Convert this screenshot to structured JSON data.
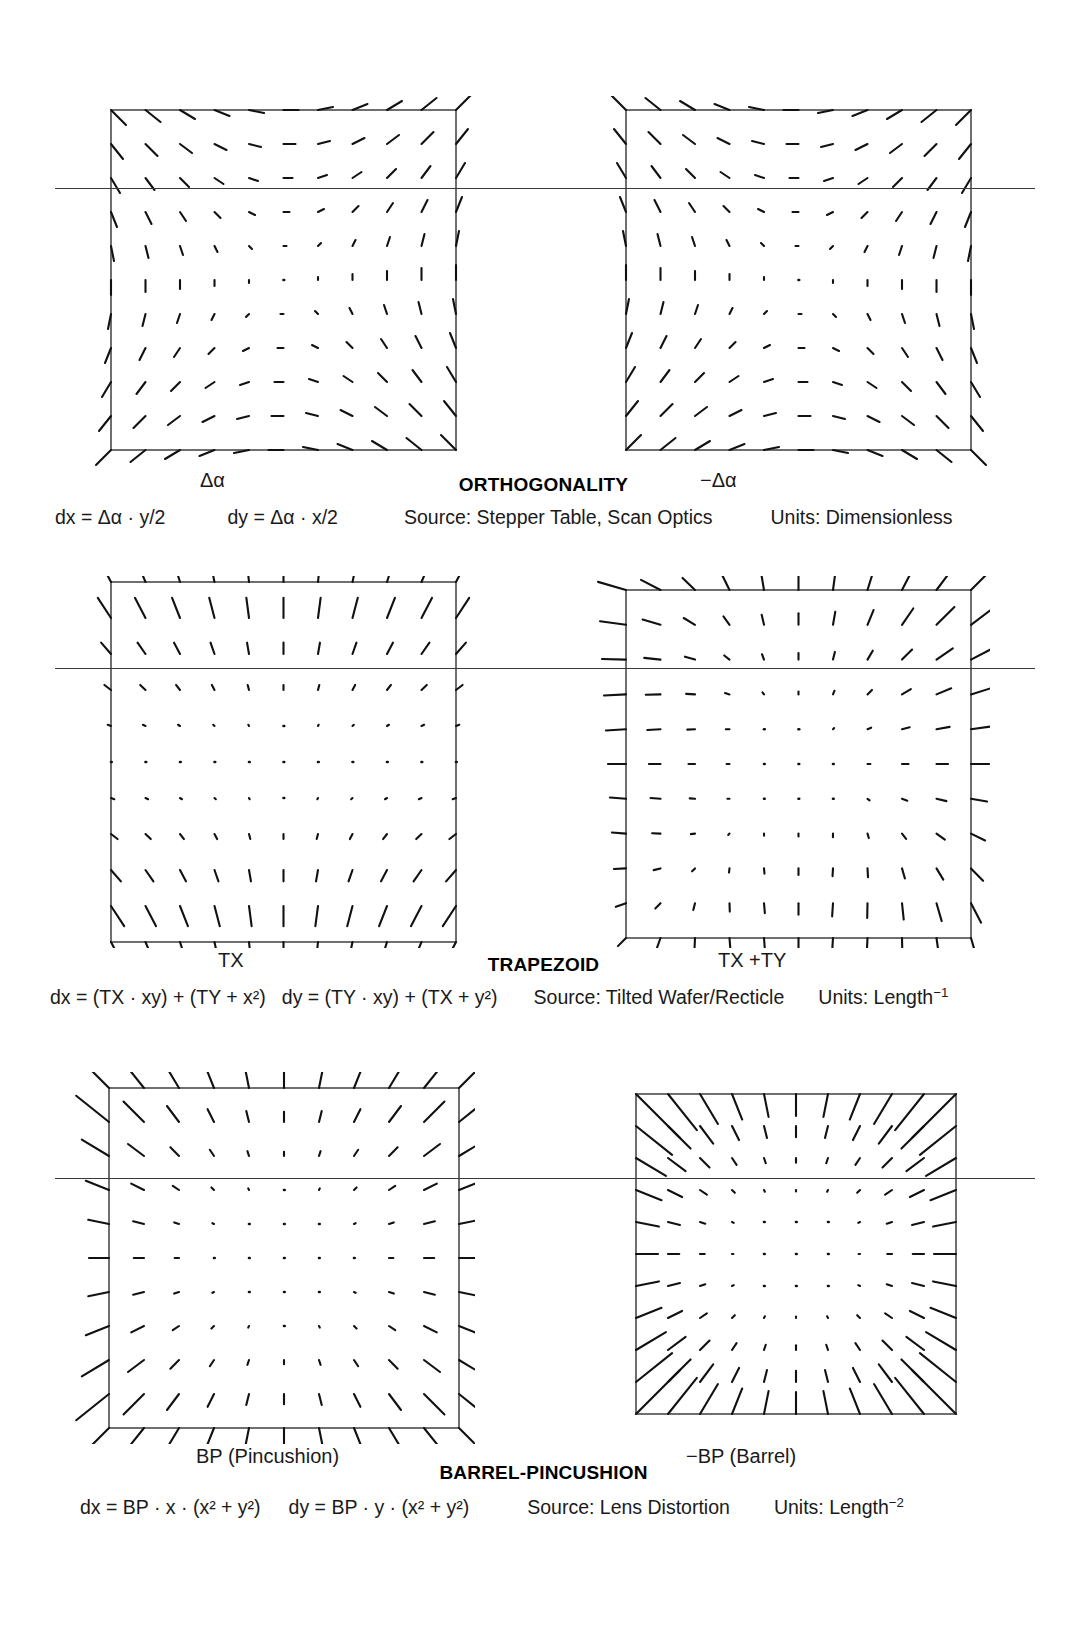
{
  "sections": [
    {
      "id": "orthogonality",
      "title": "ORTHOGONALITY",
      "left_panel_label": "Δα",
      "right_panel_label": "−Δα",
      "formula_dx": "dx = Δα · y/2",
      "formula_dy": "dy = Δα · x/2",
      "source": "Source: Stepper Table, Scan Optics",
      "units_prefix": "Units: Dimensionless",
      "units_sup": ""
    },
    {
      "id": "trapezoid",
      "title": "TRAPEZOID",
      "left_panel_label": "TX",
      "right_panel_label": "TX +TY",
      "formula_dx": "dx = (TX · xy) + (TY + x²)",
      "formula_dy": "dy = (TY · xy) + (TX + y²)",
      "source": "Source: Tilted Wafer/Recticle",
      "units_prefix": "Units: Length",
      "units_sup": "−1"
    },
    {
      "id": "barrel-pincushion",
      "title": "BARREL-PINCUSHION",
      "left_panel_label": "BP (Pincushion)",
      "right_panel_label": "−BP (Barrel)",
      "formula_dx": "dx = BP · x · (x² + y²)",
      "formula_dy": "dy = BP · y · (x² + y²)",
      "source": "Source: Lens Distortion",
      "units_prefix": "Units: Length",
      "units_sup": "−2"
    }
  ],
  "chart_data": {
    "type": "quiver",
    "grid": {
      "nx": 11,
      "ny": 11,
      "x_range": [
        -1,
        1
      ],
      "y_range": [
        -1,
        1
      ]
    },
    "axes": {
      "frame": "square box border drawn, no tick labels, no numeric axes"
    },
    "panels": [
      {
        "id": "orthogonality-positive",
        "label": "Δα",
        "row": "ORTHOGONALITY",
        "dx_expr": "k * y",
        "dy_expr": "k * x",
        "k": 1.0,
        "note": "Pure shear: arrows point outward along the x=y diagonal and inward along x=-y; magnitude zero at center, maximum at corners."
      },
      {
        "id": "orthogonality-negative",
        "label": "−Δα",
        "row": "ORTHOGONALITY",
        "dx_expr": "k * y",
        "dy_expr": "k * x",
        "k": -1.0,
        "note": "Mirror image of the positive orthogonality field."
      },
      {
        "id": "trapezoid-tx",
        "label": "TX",
        "row": "TRAPEZOID",
        "dx_expr": "k * x * y",
        "dy_expr": "k * y * y * sign(y)",
        "k": 1.0,
        "note": "Predominantly vertical arrows; magnitude grows with |y|, direction reverses across the horizontal midline and fans outward with x."
      },
      {
        "id": "trapezoid-tx-ty",
        "label": "TX +TY",
        "row": "TRAPEZOID",
        "dx_expr": "k * (x*x*sign(x) + x*y)",
        "dy_expr": "k * (y*y*sign(y) + x*y)",
        "k": 1.0,
        "note": "Combined TX and TY trapezoid; largest arrows along the left edge and the lower-left / upper-right diagonal."
      },
      {
        "id": "bp-pincushion",
        "label": "BP (Pincushion)",
        "row": "BARREL-PINCUSHION",
        "dx_expr": "k * x * (x*x + y*y)",
        "dy_expr": "k * y * (x*x + y*y)",
        "k": 1.0,
        "note": "Radially outward, magnitude proportional to r^3: near-zero at the center, longest at the corners."
      },
      {
        "id": "bp-barrel",
        "label": "−BP (Barrel)",
        "row": "BARREL-PINCUSHION",
        "dx_expr": "k * x * (x*x + y*y)",
        "dy_expr": "k * y * (x*x + y*y)",
        "k": -1.0,
        "note": "Radially inward, magnitude proportional to r^3: near-zero at the center, longest at the corners."
      }
    ]
  }
}
